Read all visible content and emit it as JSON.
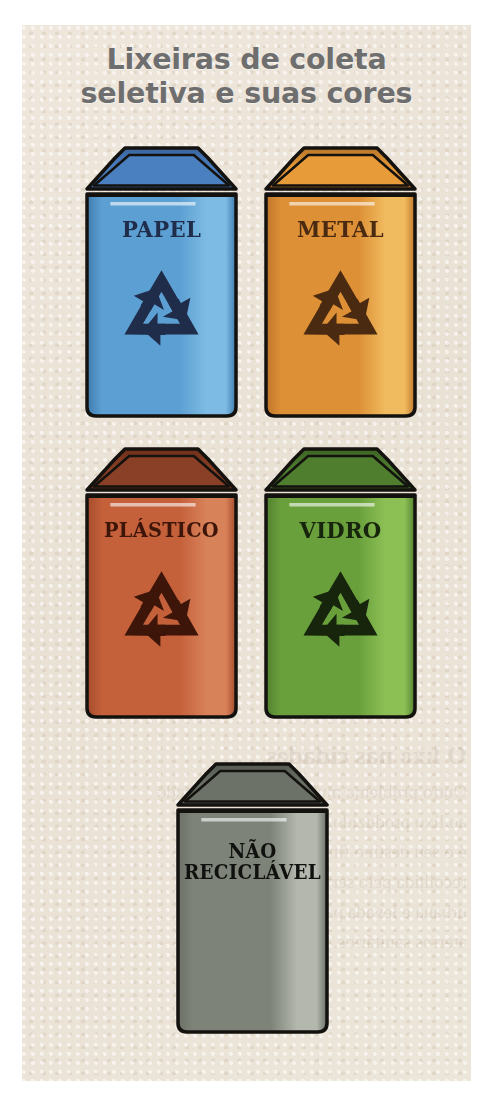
{
  "page": {
    "title": "Lixeiras de coleta\nseletiva e suas cores",
    "background_color": "#ece4d8",
    "title_color": "#6e6e6e",
    "outer_color": "#ffffff"
  },
  "legend": {
    "recycle_icon": "recycling-symbol",
    "recycle_icon_label": "Símbolo de reciclagem"
  },
  "bins": [
    {
      "id": "papel",
      "label": "PAPEL",
      "material": "Papel",
      "color_name": "Azul",
      "body_color": "#5c9fd2",
      "body_color_dark": "#3f7cae",
      "body_color_light": "#7dbbe4",
      "lid_color": "#4a7fc0",
      "lid_color_dark": "#3a66a0",
      "label_color": "#1f2c4a",
      "has_recycle_symbol": true,
      "x": 84,
      "y": 146,
      "w": 155,
      "h": 272
    },
    {
      "id": "metal",
      "label": "METAL",
      "material": "Metal",
      "color_name": "Amarelo",
      "body_color": "#dd9036",
      "body_color_dark": "#c0762a",
      "body_color_light": "#f0ba5e",
      "lid_color": "#e79b39",
      "lid_color_dark": "#b9762b",
      "label_color": "#4a2a10",
      "has_recycle_symbol": true,
      "x": 263,
      "y": 146,
      "w": 155,
      "h": 272
    },
    {
      "id": "plastico",
      "label": "PLÁSTICO",
      "material": "Plástico",
      "color_name": "Vermelho",
      "body_color": "#c4603a",
      "body_color_dark": "#a54c2c",
      "body_color_light": "#d8825a",
      "lid_color": "#8a4026",
      "lid_color_dark": "#6e3019",
      "label_color": "#3d1609",
      "has_recycle_symbol": true,
      "x": 84,
      "y": 447,
      "w": 155,
      "h": 272
    },
    {
      "id": "vidro",
      "label": "VIDRO",
      "material": "Vidro",
      "color_name": "Verde",
      "body_color": "#6aa03c",
      "body_color_dark": "#538130",
      "body_color_light": "#8cc055",
      "lid_color": "#4e7e2e",
      "lid_color_dark": "#3d6524",
      "label_color": "#16250c",
      "has_recycle_symbol": true,
      "x": 263,
      "y": 447,
      "w": 155,
      "h": 272
    },
    {
      "id": "nao-reciclavel",
      "label": "NÃO\nRECICLÁVEL",
      "material": "Não reciclável",
      "color_name": "Cinza",
      "body_color": "#7d8378",
      "body_color_dark": "#6b7167",
      "body_color_light": "#b3b7ae",
      "lid_color": "#6d7268",
      "lid_color_dark": "#565b52",
      "label_color": "#10110e",
      "has_recycle_symbol": false,
      "x": 175,
      "y": 762,
      "w": 155,
      "h": 272
    }
  ],
  "bleed_through": {
    "note": "Texto do verso da página, visível por transparência",
    "lines": [
      "O lixo nas cidades",
      "Outro problema muito grave relacionado",
      "ao lixo produzido nas grandes cidades",
      "é o seu destino final. Parte dele é",
      "recolhida pelo serviço de limpeza",
      "urbana e levada para os lixões ou",
      "aterros sanitários."
    ]
  }
}
